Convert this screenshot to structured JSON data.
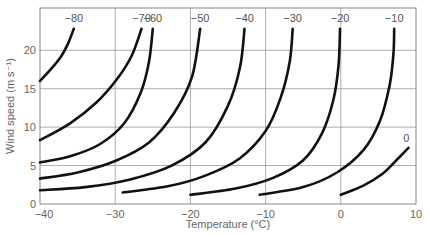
{
  "chart_data": {
    "type": "line",
    "title": "",
    "xlabel": "Temperature (°C)",
    "ylabel": "Wind speed (m s⁻¹)",
    "xlim": [
      -40,
      10
    ],
    "ylim": [
      0,
      25.5
    ],
    "xticks": [
      -40,
      -30,
      -20,
      -10,
      0,
      10
    ],
    "yticks": [
      0,
      5,
      10,
      15,
      20
    ],
    "grid": true,
    "legend": "none (curves labelled at their ends)",
    "series": [
      {
        "name": "-80",
        "label_pos": [
          -35.5,
          24.2
        ],
        "points": [
          [
            -40,
            16.0
          ],
          [
            -38.5,
            17.6
          ],
          [
            -37.2,
            19.2
          ],
          [
            -36.3,
            20.8
          ],
          [
            -35.5,
            22.8
          ]
        ]
      },
      {
        "name": "-70",
        "label_pos": [
          -26.5,
          24.2
        ],
        "points": [
          [
            -40,
            8.3
          ],
          [
            -36,
            10.5
          ],
          [
            -32.5,
            13.2
          ],
          [
            -29.8,
            16.2
          ],
          [
            -27.8,
            19.3
          ],
          [
            -26.5,
            22.8
          ]
        ]
      },
      {
        "name": "-60",
        "label_pos": [
          -25,
          24.2
        ],
        "points": [
          [
            -40,
            5.4
          ],
          [
            -36,
            6.2
          ],
          [
            -32,
            7.8
          ],
          [
            -28.8,
            10.5
          ],
          [
            -26.6,
            14.5
          ],
          [
            -25.5,
            18.5
          ],
          [
            -25,
            22.8
          ]
        ]
      },
      {
        "name": "-50",
        "label_pos": [
          -18.7,
          24.2
        ],
        "points": [
          [
            -40,
            3.3
          ],
          [
            -35,
            4.1
          ],
          [
            -30,
            5.6
          ],
          [
            -25.5,
            8.0
          ],
          [
            -22.2,
            11.8
          ],
          [
            -19.8,
            16.5
          ],
          [
            -18.7,
            22.8
          ]
        ]
      },
      {
        "name": "-40",
        "label_pos": [
          -12.8,
          24.2
        ],
        "points": [
          [
            -40,
            1.8
          ],
          [
            -34,
            2.2
          ],
          [
            -28,
            3.2
          ],
          [
            -22.5,
            5.0
          ],
          [
            -18,
            8.0
          ],
          [
            -15,
            12.8
          ],
          [
            -13.4,
            17.8
          ],
          [
            -12.8,
            22.8
          ]
        ]
      },
      {
        "name": "-30",
        "label_pos": [
          -6.4,
          24.2
        ],
        "points": [
          [
            -29,
            1.5
          ],
          [
            -23,
            2.3
          ],
          [
            -18,
            3.7
          ],
          [
            -13.5,
            5.9
          ],
          [
            -10,
            9.5
          ],
          [
            -8,
            13.8
          ],
          [
            -6.8,
            18.5
          ],
          [
            -6.4,
            22.8
          ]
        ]
      },
      {
        "name": "-20",
        "label_pos": [
          -0.1,
          24.2
        ],
        "points": [
          [
            -20,
            1.2
          ],
          [
            -14,
            2.0
          ],
          [
            -9,
            3.4
          ],
          [
            -5,
            5.7
          ],
          [
            -2.5,
            9.2
          ],
          [
            -1,
            13.5
          ],
          [
            -0.3,
            18.0
          ],
          [
            -0.1,
            22.8
          ]
        ]
      },
      {
        "name": "-10",
        "label_pos": [
          7.1,
          24.2
        ],
        "points": [
          [
            -10.8,
            1.2
          ],
          [
            -5,
            2.2
          ],
          [
            -0.5,
            4.1
          ],
          [
            3,
            7.0
          ],
          [
            5.2,
            10.8
          ],
          [
            6.5,
            15.5
          ],
          [
            7.0,
            19.5
          ],
          [
            7.1,
            22.8
          ]
        ]
      },
      {
        "name": "0",
        "label_pos": [
          8.7,
          8.6
        ],
        "points": [
          [
            0,
            1.2
          ],
          [
            3,
            2.4
          ],
          [
            5.5,
            3.9
          ],
          [
            7.3,
            5.6
          ],
          [
            9.0,
            7.3
          ]
        ]
      }
    ]
  },
  "labels": {
    "xlabel": "Temperature (°C)",
    "ylabel": "Wind speed (m s⁻¹)"
  }
}
